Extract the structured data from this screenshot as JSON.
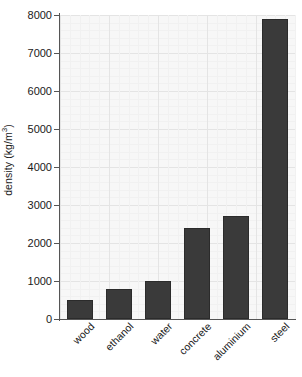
{
  "chart_data": {
    "type": "bar",
    "title": "",
    "subtitle": "",
    "xlabel": "",
    "ylabel": "density (kg/m3)",
    "ylabel_prefix": "density (kg/m",
    "ylabel_superscript": "3",
    "ylabel_suffix": ")",
    "categories": [
      "wood",
      "ethanol",
      "water",
      "concrete",
      "aluminium",
      "steel"
    ],
    "values": [
      500,
      800,
      1000,
      2400,
      2700,
      7900
    ],
    "ylim": [
      0,
      8000
    ],
    "yticks": [
      0,
      1000,
      2000,
      3000,
      4000,
      5000,
      6000,
      7000,
      8000
    ],
    "ytick_labels": [
      "0",
      "1000",
      "2000",
      "3000",
      "4000",
      "5000",
      "6000",
      "7000",
      "8000"
    ],
    "grid": true,
    "legend": false,
    "legend_position": "none",
    "bar_color": "#3a3a3a",
    "panel_color": "#f7f7f7",
    "grid_color": "#ececec",
    "axis_color": "#555555",
    "background_color": "#ffffff"
  }
}
